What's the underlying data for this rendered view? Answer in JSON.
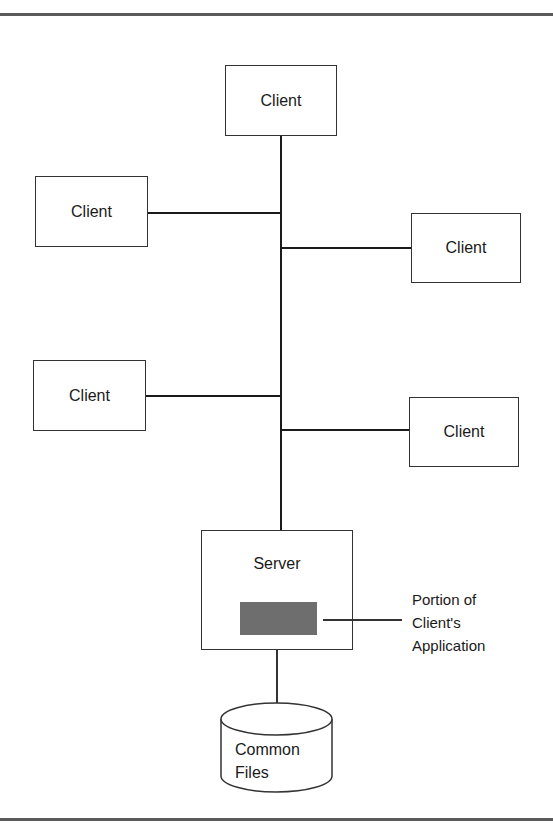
{
  "diagram": {
    "type": "client-server network",
    "clients": [
      {
        "label": "Client",
        "position": "top"
      },
      {
        "label": "Client",
        "position": "left-upper"
      },
      {
        "label": "Client",
        "position": "right-upper"
      },
      {
        "label": "Client",
        "position": "left-lower"
      },
      {
        "label": "Client",
        "position": "right-lower"
      }
    ],
    "server": {
      "label": "Server",
      "component_color": "#6e6e6e"
    },
    "annotation": {
      "line1": "Portion of",
      "line2": "Client's",
      "line3": "Application"
    },
    "storage": {
      "line1": "Common",
      "line2": "Files"
    }
  }
}
